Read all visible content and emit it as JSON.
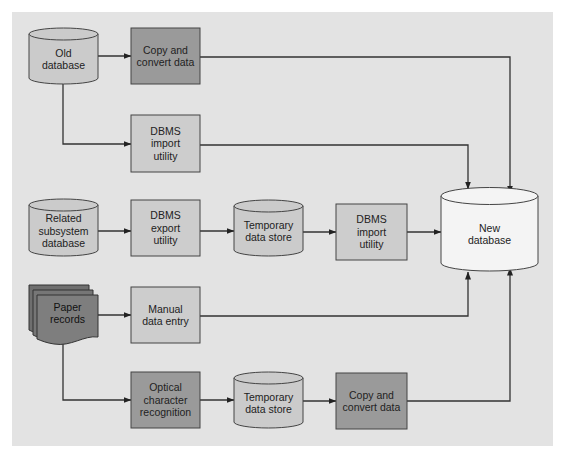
{
  "colors": {
    "panel": "#e3e3e3",
    "box_light": "#cdcdcd",
    "box_dark": "#9a9a9a",
    "cylinder": "#cbcbcb",
    "cylinder_new": "#f4f4f4",
    "paper": "#7a7a7a",
    "stroke": "#333333"
  },
  "nodes": {
    "old_database": {
      "label": "Old\ndatabase",
      "type": "cylinder"
    },
    "copy_convert_1": {
      "label": "Copy and\nconvert data",
      "type": "process-dark"
    },
    "dbms_import_1": {
      "label": "DBMS\nimport\nutility",
      "type": "process-light"
    },
    "related_database": {
      "label": "Related\nsubsystem\ndatabase",
      "type": "cylinder"
    },
    "dbms_export": {
      "label": "DBMS\nexport\nutility",
      "type": "process-light"
    },
    "temp_store_1": {
      "label": "Temporary\ndata store",
      "type": "cylinder"
    },
    "dbms_import_2": {
      "label": "DBMS\nimport\nutility",
      "type": "process-light"
    },
    "new_database": {
      "label": "New\ndatabase",
      "type": "cylinder"
    },
    "paper_records": {
      "label": "Paper\nrecords",
      "type": "document-stack"
    },
    "manual_entry": {
      "label": "Manual\ndata entry",
      "type": "process-light"
    },
    "ocr": {
      "label": "Optical\ncharacter\nrecognition",
      "type": "process-dark"
    },
    "temp_store_2": {
      "label": "Temporary\ndata store",
      "type": "cylinder"
    },
    "copy_convert_2": {
      "label": "Copy and\nconvert data",
      "type": "process-dark"
    }
  },
  "edges": [
    {
      "from": "old_database",
      "to": "copy_convert_1"
    },
    {
      "from": "old_database",
      "to": "dbms_import_1"
    },
    {
      "from": "copy_convert_1",
      "to": "new_database"
    },
    {
      "from": "dbms_import_1",
      "to": "new_database"
    },
    {
      "from": "related_database",
      "to": "dbms_export"
    },
    {
      "from": "dbms_export",
      "to": "temp_store_1"
    },
    {
      "from": "temp_store_1",
      "to": "dbms_import_2"
    },
    {
      "from": "dbms_import_2",
      "to": "new_database"
    },
    {
      "from": "paper_records",
      "to": "manual_entry"
    },
    {
      "from": "paper_records",
      "to": "ocr"
    },
    {
      "from": "manual_entry",
      "to": "new_database"
    },
    {
      "from": "ocr",
      "to": "temp_store_2"
    },
    {
      "from": "temp_store_2",
      "to": "copy_convert_2"
    },
    {
      "from": "copy_convert_2",
      "to": "new_database"
    }
  ]
}
